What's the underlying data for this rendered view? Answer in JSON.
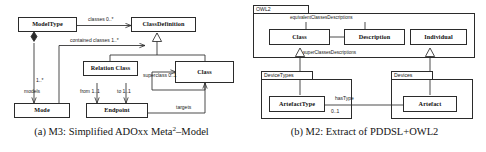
{
  "figure": {
    "panels": [
      {
        "id": "panel-a",
        "caption_prefix": "(a)",
        "caption_text": "M3: Simplified ADOxx Meta",
        "caption_sup": "2",
        "caption_suffix": "–Model",
        "classes": [
          {
            "name": "ModelType"
          },
          {
            "name": "ClassDefinition"
          },
          {
            "name": "Relation Class"
          },
          {
            "name": "Class"
          },
          {
            "name": "Mode"
          },
          {
            "name": "Endpoint"
          }
        ],
        "edge_labels": [
          {
            "text": "classes 0..*"
          },
          {
            "text": "contained classes 1..*"
          },
          {
            "text": "superclass 0..1"
          },
          {
            "text": "1..*"
          },
          {
            "text": "models"
          },
          {
            "text": "from 1..1"
          },
          {
            "text": "to 1..1"
          },
          {
            "text": "targets"
          }
        ]
      },
      {
        "id": "panel-b",
        "caption_prefix": "(b)",
        "caption_text": "M2: Extract of PDDSL+OWL2",
        "caption_sup": "",
        "caption_suffix": "",
        "packages": [
          {
            "name": "OWL2"
          },
          {
            "name": "DeviceTypes"
          },
          {
            "name": "Devices"
          }
        ],
        "classes": [
          {
            "name": "Class"
          },
          {
            "name": "Description"
          },
          {
            "name": "Individual"
          },
          {
            "name": "ArtefactType"
          },
          {
            "name": "Artefact"
          }
        ],
        "edge_labels": [
          {
            "text": "equivalentClassesDescriptions"
          },
          {
            "text": "superClassesDescriptions"
          },
          {
            "text": "hasType"
          },
          {
            "text": "0..1"
          }
        ]
      }
    ]
  },
  "colors": {
    "stroke": "#2b2b2b",
    "text": "#101010",
    "background": "#ffffff"
  }
}
